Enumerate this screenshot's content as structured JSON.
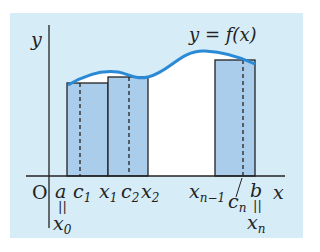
{
  "diagram": {
    "title_label": "y = f(x)",
    "axes": {
      "y_label": "y",
      "x_label": "x",
      "origin_label": "O"
    },
    "colors": {
      "panel_background": "#d6ecf6",
      "rectangle_fill": "#a9cdeb",
      "area_under_curve": "#ffffff",
      "curve": "#2a8ad6",
      "outline": "#222222"
    },
    "x_ticks": [
      {
        "id": "a",
        "text": "a",
        "below_eq": "x",
        "below_sub": "0"
      },
      {
        "id": "c1",
        "text": "c",
        "sub": "1"
      },
      {
        "id": "x1",
        "text": "x",
        "sub": "1"
      },
      {
        "id": "c2",
        "text": "c",
        "sub": "2"
      },
      {
        "id": "x2",
        "text": "x",
        "sub": "2"
      },
      {
        "id": "xn-1",
        "text": "x",
        "sub": "n−1"
      },
      {
        "id": "cn",
        "text": "c",
        "sub": "n"
      },
      {
        "id": "b",
        "text": "b",
        "below_eq": "x",
        "below_sub": "n"
      }
    ],
    "equals_sign": "||",
    "rectangles": [
      {
        "name": "rect-1",
        "from": "a",
        "to": "x1",
        "sample": "c1"
      },
      {
        "name": "rect-2",
        "from": "x1",
        "to": "x2",
        "sample": "c2"
      },
      {
        "name": "rect-n",
        "from": "xn-1",
        "to": "b",
        "sample": "cn"
      }
    ]
  }
}
